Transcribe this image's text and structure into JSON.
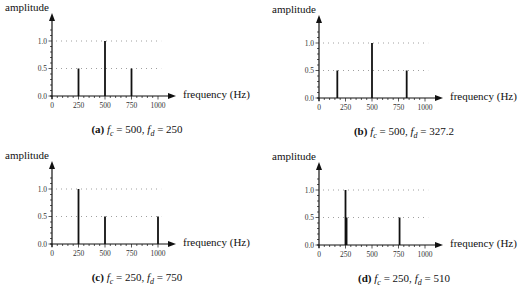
{
  "chart_data": [
    {
      "type": "bar",
      "panel": "a",
      "caption_letter": "(a)",
      "fc": "500",
      "fd": "250",
      "title": "(a) f_c = 500, f_d = 250",
      "xlabel": "frequency (Hz)",
      "ylabel": "amplitude",
      "xlim": [
        0,
        1000
      ],
      "ylim": [
        0,
        1.0
      ],
      "xticks": [
        0,
        250,
        500,
        750,
        1000
      ],
      "yticks": [
        0.0,
        0.5,
        1.0
      ],
      "grid": "dotted at 0.5 and 1.0",
      "x": [
        250,
        500,
        750
      ],
      "values": [
        0.5,
        1.0,
        0.5
      ]
    },
    {
      "type": "bar",
      "panel": "b",
      "caption_letter": "(b)",
      "fc": "500",
      "fd": "327.2",
      "title": "(b) f_c = 500, f_d = 327.2",
      "xlabel": "frequency (Hz)",
      "ylabel": "amplitude",
      "xlim": [
        0,
        1000
      ],
      "ylim": [
        0,
        1.0
      ],
      "xticks": [
        0,
        250,
        500,
        750,
        1000
      ],
      "yticks": [
        0.0,
        0.5,
        1.0
      ],
      "grid": "dotted at 0.5 and 1.0",
      "x": [
        172.8,
        500,
        827.2
      ],
      "values": [
        0.5,
        1.0,
        0.5
      ]
    },
    {
      "type": "bar",
      "panel": "c",
      "caption_letter": "(c)",
      "fc": "250",
      "fd": "750",
      "title": "(c) f_c = 250, f_d = 750",
      "xlabel": "frequency (Hz)",
      "ylabel": "amplitude",
      "xlim": [
        0,
        1000
      ],
      "ylim": [
        0,
        1.0
      ],
      "xticks": [
        0,
        250,
        500,
        750,
        1000
      ],
      "yticks": [
        0.0,
        0.5,
        1.0
      ],
      "grid": "dotted at 0.5 and 1.0",
      "x": [
        250,
        500,
        1000
      ],
      "values": [
        1.0,
        0.5,
        0.5
      ]
    },
    {
      "type": "bar",
      "panel": "d",
      "caption_letter": "(d)",
      "fc": "250",
      "fd": "510",
      "title": "(d) f_c = 250, f_d = 510",
      "xlabel": "frequency (Hz)",
      "ylabel": "amplitude",
      "xlim": [
        0,
        1000
      ],
      "ylim": [
        0,
        1.0
      ],
      "xticks": [
        0,
        250,
        500,
        750,
        1000
      ],
      "yticks": [
        0.0,
        0.5,
        1.0
      ],
      "grid": "dotted at 0.5 and 1.0",
      "x": [
        250,
        260,
        760
      ],
      "values": [
        1.0,
        0.5,
        0.5
      ]
    }
  ],
  "labels": {
    "ylabel": "amplitude",
    "xlabel": "frequency (Hz)",
    "fc_sym": "f",
    "fc_sub": "c",
    "fd_sym": "f",
    "fd_sub": "d",
    "eq": " = ",
    "comma": ", "
  },
  "colors": {
    "axis": "#111111",
    "bar": "#111111",
    "grid": "#888888"
  }
}
